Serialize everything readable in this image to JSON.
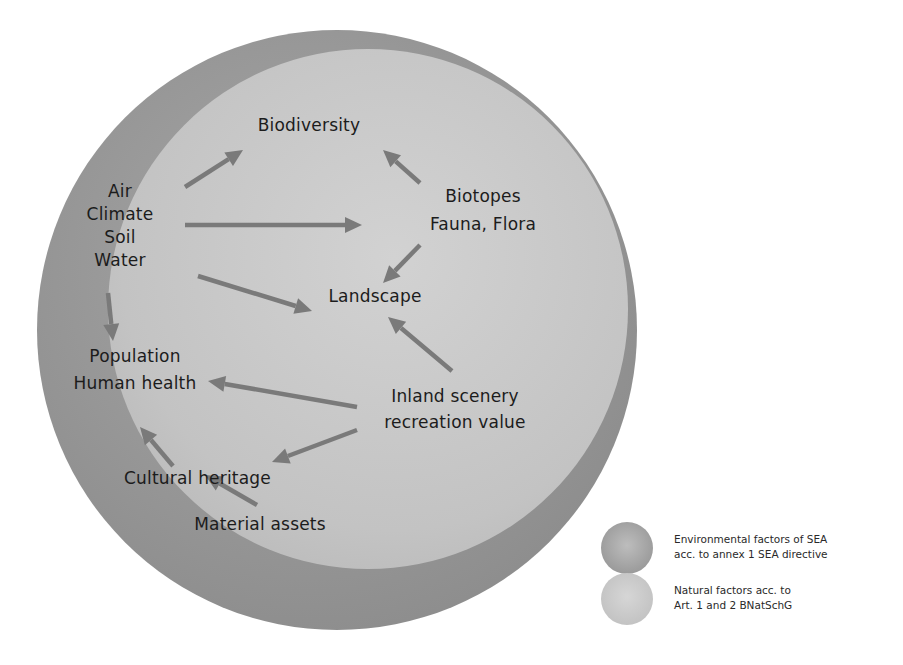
{
  "diagram": {
    "type": "concept-diagram",
    "outer_circle": {
      "meaning": "Environmental factors of SEA",
      "color": "#8f8f8f",
      "cx": 337,
      "cy": 330,
      "r": 300
    },
    "inner_circle": {
      "meaning": "Natural factors",
      "color": "#c4c4c4",
      "cx": 368,
      "cy": 309,
      "r": 260
    },
    "arrow_color": "#7a7a7a",
    "nodes": {
      "biodiversity": {
        "lines": [
          "Biodiversity"
        ]
      },
      "abiotic": {
        "lines": [
          "Air",
          "Climate",
          "Soil",
          "Water"
        ]
      },
      "biotopes": {
        "lines": [
          "Biotopes",
          "Fauna, Flora"
        ]
      },
      "landscape": {
        "lines": [
          "Landscape"
        ]
      },
      "population": {
        "lines": [
          "Population",
          "Human health"
        ]
      },
      "scenery": {
        "lines": [
          "Inland scenery",
          "recreation value"
        ]
      },
      "cultural": {
        "lines": [
          "Cultural heritage"
        ]
      },
      "material": {
        "lines": [
          "Material assets"
        ]
      }
    },
    "edges": [
      {
        "from": "abiotic",
        "to": "biodiversity",
        "x1": 185,
        "y1": 187,
        "x2": 243,
        "y2": 150
      },
      {
        "from": "abiotic",
        "to": "biotopes",
        "x1": 185,
        "y1": 225,
        "x2": 362,
        "y2": 225
      },
      {
        "from": "abiotic",
        "to": "landscape",
        "x1": 198,
        "y1": 276,
        "x2": 312,
        "y2": 311
      },
      {
        "from": "abiotic",
        "to": "population",
        "x1": 108,
        "y1": 293,
        "x2": 113,
        "y2": 341
      },
      {
        "from": "biotopes",
        "to": "biodiversity",
        "x1": 420,
        "y1": 183,
        "x2": 383,
        "y2": 150
      },
      {
        "from": "biotopes",
        "to": "landscape",
        "x1": 420,
        "y1": 245,
        "x2": 383,
        "y2": 283
      },
      {
        "from": "scenery",
        "to": "landscape",
        "x1": 452,
        "y1": 371,
        "x2": 388,
        "y2": 317
      },
      {
        "from": "scenery",
        "to": "population",
        "x1": 357,
        "y1": 407,
        "x2": 208,
        "y2": 381
      },
      {
        "from": "scenery",
        "to": "cultural",
        "x1": 357,
        "y1": 430,
        "x2": 272,
        "y2": 462
      },
      {
        "from": "cultural",
        "to": "population",
        "x1": 173,
        "y1": 466,
        "x2": 140,
        "y2": 427
      },
      {
        "from": "material",
        "to": "cultural",
        "x1": 257,
        "y1": 505,
        "x2": 205,
        "y2": 475
      }
    ]
  },
  "legend": {
    "items": [
      {
        "lines": [
          "Environmental factors of SEA",
          "acc. to annex 1 SEA directive"
        ],
        "color": "#9c9c9c"
      },
      {
        "lines": [
          "Natural factors acc. to",
          "Art. 1 and 2 BNatSchG"
        ],
        "color": "#c8c8c8"
      }
    ]
  }
}
